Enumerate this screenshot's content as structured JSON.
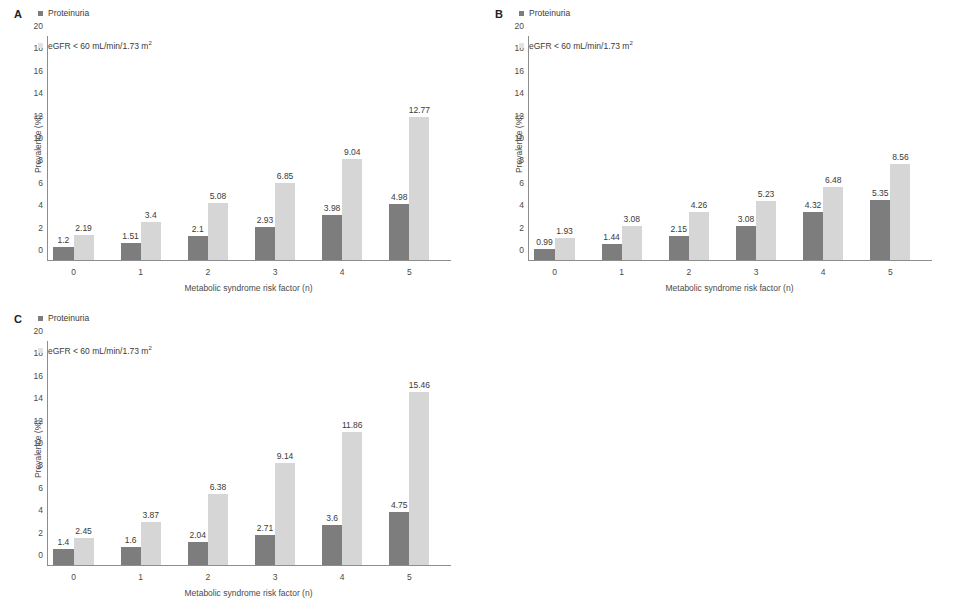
{
  "figure": {
    "panels": [
      "A",
      "B",
      "C"
    ],
    "colors": {
      "proteinuria_bar": "#7d7d7d",
      "egfr_bar": "#d6d6d6",
      "axis": "#8d8d8d",
      "text": "#3a3a3a",
      "background": "#ffffff"
    },
    "shared": {
      "ylabel": "Prevalence (%)",
      "xlabel": "Metabolic syndrome risk factor (n)",
      "legend": {
        "series1": "Proteinuria",
        "series2_prefix": "eGFR < 60 mL/min/1.73 m",
        "series2_sup": "2"
      },
      "yticks": [
        "0",
        "2",
        "4",
        "6",
        "8",
        "10",
        "12",
        "14",
        "16",
        "18",
        "20"
      ],
      "xticks": [
        "0",
        "1",
        "2",
        "3",
        "4",
        "5"
      ]
    }
  },
  "chart_data": [
    {
      "type": "bar",
      "panel": "A",
      "title": "A",
      "xlabel": "Metabolic syndrome risk factor (n)",
      "ylabel": "Prevalence (%)",
      "categories": [
        "0",
        "1",
        "2",
        "3",
        "4",
        "5"
      ],
      "ylim": [
        0,
        20
      ],
      "ytick_step": 2,
      "grid": false,
      "legend_position": "top-left",
      "series": [
        {
          "name": "Proteinuria",
          "color": "#7d7d7d",
          "values": [
            1.2,
            1.51,
            2.1,
            2.93,
            3.98,
            4.98
          ],
          "labels": [
            "1.2",
            "1.51",
            "2.1",
            "2.93",
            "3.98",
            "4.98"
          ]
        },
        {
          "name": "eGFR < 60 mL/min/1.73 m2",
          "color": "#d6d6d6",
          "values": [
            2.19,
            3.4,
            5.08,
            6.85,
            9.04,
            12.77
          ],
          "labels": [
            "2.19",
            "3.4",
            "5.08",
            "6.85",
            "9.04",
            "12.77"
          ]
        }
      ]
    },
    {
      "type": "bar",
      "panel": "B",
      "title": "B",
      "xlabel": "Metabolic syndrome risk factor (n)",
      "ylabel": "Prevalence (%)",
      "categories": [
        "0",
        "1",
        "2",
        "3",
        "4",
        "5"
      ],
      "ylim": [
        0,
        20
      ],
      "ytick_step": 2,
      "grid": false,
      "legend_position": "top-left",
      "series": [
        {
          "name": "Proteinuria",
          "color": "#7d7d7d",
          "values": [
            0.99,
            1.44,
            2.15,
            3.08,
            4.32,
            5.35
          ],
          "labels": [
            "0.99",
            "1.44",
            "2.15",
            "3.08",
            "4.32",
            "5.35"
          ]
        },
        {
          "name": "eGFR < 60 mL/min/1.73 m2",
          "color": "#d6d6d6",
          "values": [
            1.93,
            3.08,
            4.26,
            5.23,
            6.48,
            8.56
          ],
          "labels": [
            "1.93",
            "3.08",
            "4.26",
            "5.23",
            "6.48",
            "8.56"
          ]
        }
      ]
    },
    {
      "type": "bar",
      "panel": "C",
      "title": "C",
      "xlabel": "Metabolic syndrome risk factor (n)",
      "ylabel": "Prevalence (%)",
      "categories": [
        "0",
        "1",
        "2",
        "3",
        "4",
        "5"
      ],
      "ylim": [
        0,
        20
      ],
      "ytick_step": 2,
      "grid": false,
      "legend_position": "top-left",
      "series": [
        {
          "name": "Proteinuria",
          "color": "#7d7d7d",
          "values": [
            1.4,
            1.6,
            2.04,
            2.71,
            3.6,
            4.75
          ],
          "labels": [
            "1.4",
            "1.6",
            "2.04",
            "2.71",
            "3.6",
            "4.75"
          ]
        },
        {
          "name": "eGFR < 60 mL/min/1.73 m2",
          "color": "#d6d6d6",
          "values": [
            2.45,
            3.87,
            6.38,
            9.14,
            11.86,
            15.46
          ],
          "labels": [
            "2.45",
            "3.87",
            "6.38",
            "9.14",
            "11.86",
            "15.46"
          ]
        }
      ]
    }
  ]
}
